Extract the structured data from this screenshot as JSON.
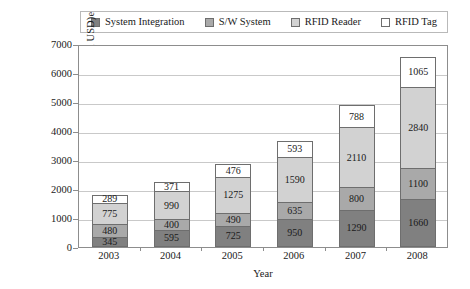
{
  "chart_data": {
    "type": "bar",
    "subtype": "stacked-vertical",
    "title": "",
    "xlabel": "Year",
    "ylabel": "Revenue (Million USD)e",
    "categories": [
      "2003",
      "2004",
      "2005",
      "2006",
      "2007",
      "2008"
    ],
    "ylim": [
      0,
      7000
    ],
    "ytick_values": [
      0,
      1000,
      2000,
      3000,
      4000,
      5000,
      6000,
      7000
    ],
    "ytick_labels": [
      "0",
      "1000",
      "2000",
      "3000",
      "4000",
      "5000",
      "6000",
      "7000"
    ],
    "grid": true,
    "grid_axis": "y",
    "legend_position": "top",
    "series": [
      {
        "name": "System Integration",
        "color": "#808080",
        "values": [
          345,
          595,
          725,
          950,
          1290,
          1660
        ],
        "labels": [
          "345",
          "595",
          "725",
          "950",
          "1290",
          "1660"
        ]
      },
      {
        "name": "S/W System",
        "color": "#a9a9a9",
        "values": [
          480,
          400,
          490,
          635,
          800,
          1100
        ],
        "labels": [
          "480",
          "400",
          "490",
          "635",
          "800",
          "1100"
        ]
      },
      {
        "name": "RFID Reader",
        "color": "#d2d2d2",
        "values": [
          775,
          990,
          1275,
          1590,
          2110,
          2840
        ],
        "labels": [
          "775",
          "990",
          "1275",
          "1590",
          "2110",
          "2840"
        ]
      },
      {
        "name": "RFID Tag",
        "color": "#ffffff",
        "values": [
          289,
          371,
          476,
          593,
          788,
          1065
        ],
        "labels": [
          "289",
          "371",
          "476",
          "593",
          "788",
          "1065"
        ]
      }
    ],
    "totals": [
      1889,
      2356,
      2966,
      3768,
      4988,
      6665
    ]
  },
  "legend": {
    "items": [
      {
        "label": "System Integration",
        "color": "#808080"
      },
      {
        "label": "S/W System",
        "color": "#a9a9a9"
      },
      {
        "label": "RFID Reader",
        "color": "#d2d2d2"
      },
      {
        "label": "RFID Tag",
        "color": "#ffffff"
      }
    ]
  },
  "colors": {
    "system_integration": "#808080",
    "sw_system": "#a9a9a9",
    "rfid_reader": "#d2d2d2",
    "rfid_tag": "#ffffff",
    "gridline": "#c9c9c9",
    "axis": "#8d8d8d",
    "text": "#1a1a1a"
  }
}
